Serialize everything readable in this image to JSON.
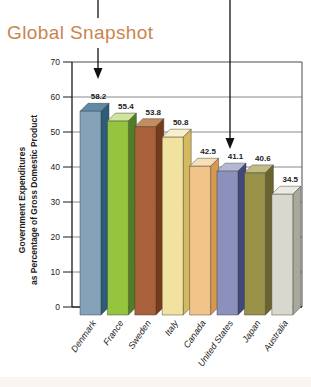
{
  "title": {
    "text": "Global Snapshot",
    "color": "#c9854f"
  },
  "chart_data": {
    "type": "bar",
    "title": "Global Snapshot",
    "categories": [
      "Denmark",
      "France",
      "Sweden",
      "Italy",
      "Canada",
      "United States",
      "Japan",
      "Australia"
    ],
    "values": [
      58.2,
      55.4,
      53.8,
      50.8,
      42.5,
      41.1,
      40.6,
      34.5
    ],
    "value_labels": [
      "58.2",
      "55.4",
      "53.8",
      "50.8",
      "42.5",
      "41.1",
      "40.6",
      "34.5"
    ],
    "ylabel_line1": "Government Expenditures",
    "ylabel_line2": "as Percentage of Gross Domestic Product",
    "xlabel": "",
    "ylim": [
      0,
      70
    ],
    "y_ticks": [
      0,
      10,
      20,
      30,
      40,
      50,
      60,
      70
    ],
    "grid": "horizontal",
    "legend": "none",
    "bar_style": "3d",
    "bar_colors": [
      {
        "name": "Denmark",
        "front": "#84a2ba",
        "top": "#5e89a7",
        "side": "#2d5c7a"
      },
      {
        "name": "France",
        "front": "#95c53e",
        "top": "#cfe49c",
        "side": "#4f7f22"
      },
      {
        "name": "Sweden",
        "front": "#a8613a",
        "top": "#c68c5f",
        "side": "#773a1d"
      },
      {
        "name": "Italy",
        "front": "#f2e2a0",
        "top": "#f9f0cb",
        "side": "#d5b95f"
      },
      {
        "name": "Canada",
        "front": "#f1c489",
        "top": "#f8dfb9",
        "side": "#d8994f"
      },
      {
        "name": "United States",
        "front": "#8b90bc",
        "top": "#b4b8d5",
        "side": "#40487e"
      },
      {
        "name": "Japan",
        "front": "#9a9248",
        "top": "#c2bc83",
        "side": "#69632f"
      },
      {
        "name": "Australia",
        "front": "#d8d8cf",
        "top": "#eaeae2",
        "side": "#a8a89d"
      }
    ],
    "axis_color": "#1a1a1a",
    "grid_color": "#6b6b6b",
    "border_color": "#4a4a4a",
    "label_color": "#1c1c1c"
  },
  "annotations": {
    "arrows": [
      {
        "x": 98,
        "segments": [
          [
            0,
            18
          ],
          [
            48,
            70
          ]
        ],
        "tip_y": 79,
        "color": "#111111"
      },
      {
        "x": 230,
        "segments": [
          [
            0,
            139
          ]
        ],
        "tip_y": 149,
        "color": "#111111"
      }
    ]
  }
}
